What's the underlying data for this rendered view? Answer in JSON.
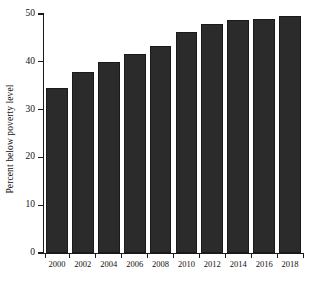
{
  "chart_data": {
    "type": "bar",
    "title": "",
    "subtitle": "",
    "xlabel": "",
    "ylabel": "Percent below poverty level",
    "categories": [
      "2000",
      "2002",
      "2004",
      "2006",
      "2008",
      "2010",
      "2012",
      "2014",
      "2016",
      "2018"
    ],
    "values": [
      34.6,
      37.9,
      40.0,
      41.7,
      43.4,
      46.3,
      47.9,
      48.7,
      49.0,
      49.5
    ],
    "series": [
      {
        "name": "Percent below poverty level",
        "values": [
          34.6,
          37.9,
          40.0,
          41.7,
          43.4,
          46.3,
          47.9,
          48.7,
          49.0,
          49.5
        ]
      }
    ],
    "ylim": [
      0,
      50
    ],
    "yticks": [
      0,
      10,
      20,
      30,
      40,
      50
    ],
    "ytick_labels": [
      "0",
      "10",
      "20",
      "30",
      "40",
      "50"
    ],
    "xtick_labels": [
      "2000",
      "2002",
      "2004",
      "2006",
      "2008",
      "2010",
      "2012",
      "2014",
      "2016",
      "2018"
    ],
    "grid": false,
    "legend": null,
    "legend_position": "none",
    "annotations": [],
    "bar_color": "#2b2b2b",
    "axis_color": "#1a1a1a",
    "background_color": "#ffffff"
  }
}
